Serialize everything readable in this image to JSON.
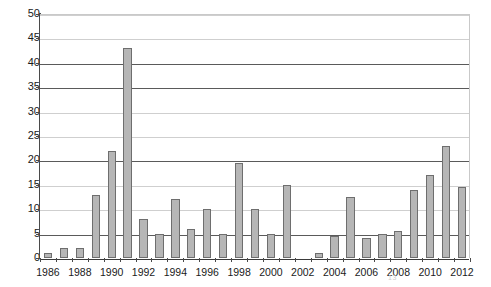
{
  "chart_data": {
    "type": "bar",
    "title": "",
    "subtitle": "",
    "xlabel": "",
    "ylabel": "",
    "categories": [
      "1986",
      "1987",
      "1988",
      "1989",
      "1990",
      "1991",
      "1992",
      "1993",
      "1994",
      "1995",
      "1996",
      "1997",
      "1998",
      "1999",
      "2000",
      "2001",
      "2002",
      "2003",
      "2004",
      "2005",
      "2006",
      "2007",
      "2008",
      "2009",
      "2010",
      "2011",
      "2012"
    ],
    "values": [
      1,
      2,
      2,
      13,
      22,
      43,
      8,
      5,
      12,
      6,
      10,
      5,
      19.5,
      10,
      5,
      15,
      0,
      1,
      4.5,
      12.5,
      4,
      5,
      5.5,
      14,
      17,
      23,
      14.5
    ],
    "ylim": [
      0,
      50
    ],
    "ytick_labels": [
      "0",
      "5",
      "10",
      "15",
      "20",
      "25",
      "30",
      "35",
      "40",
      "45",
      "50"
    ],
    "ytick_values": [
      0,
      5,
      10,
      15,
      20,
      25,
      30,
      35,
      40,
      45,
      50
    ],
    "xtick_labels": [
      "1986",
      "1988",
      "1990",
      "1992",
      "1994",
      "1996",
      "1998",
      "2000",
      "2002",
      "2004",
      "2006",
      "2008",
      "2010",
      "2012"
    ],
    "xtick_categories": [
      "1986",
      "1988",
      "1990",
      "1992",
      "1994",
      "1996",
      "1998",
      "2000",
      "2002",
      "2004",
      "2006",
      "2008",
      "2010",
      "2012"
    ],
    "grid": true,
    "grid_axis": "y",
    "major_gridlines": [
      0,
      5,
      20,
      35,
      40
    ],
    "legend": false,
    "legend_position": "none",
    "bar_color": "#b6b6b6",
    "bar_border_color": "#6e6e6e",
    "gridline_color": "#cfcfcf",
    "major_gridline_color": "#5a5a5a",
    "axis_color": "#4a4a4a",
    "background_color": "#ffffff",
    "annotations": []
  },
  "footnote": {
    "mark": "13"
  }
}
